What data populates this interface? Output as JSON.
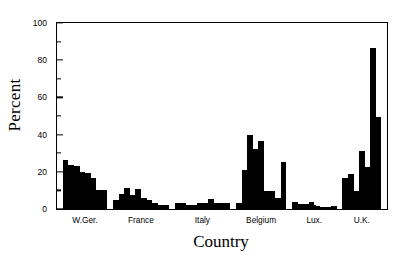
{
  "chart_data": {
    "type": "bar",
    "title": "",
    "xlabel": "Country",
    "ylabel": "Percent",
    "ylim": [
      0,
      100
    ],
    "yticks": [
      0,
      20,
      40,
      60,
      80,
      100
    ],
    "yticklabels": [
      "0",
      "20",
      "40",
      "60",
      "80",
      "100"
    ],
    "yminorticks": [
      10,
      30,
      50,
      70,
      90
    ],
    "grid": false,
    "legend": false,
    "categories": [
      "W.Ger.",
      "France",
      "Italy",
      "Belgium",
      "Lux.",
      "U.K."
    ],
    "groups": [
      {
        "label": "W.Ger.",
        "values": [
          26.5,
          23.5,
          23.0,
          20.0,
          19.5,
          16.5,
          10.0,
          10.0
        ]
      },
      {
        "label": "France",
        "values": [
          5.0,
          8.0,
          11.5,
          7.5,
          10.5,
          6.0,
          5.0,
          3.5,
          2.0,
          2.0
        ]
      },
      {
        "label": "Italy",
        "values": [
          3.5,
          3.5,
          2.0,
          2.0,
          3.0,
          3.5,
          5.5,
          3.0,
          3.0,
          3.5
        ]
      },
      {
        "label": "Belgium",
        "values": [
          3.5,
          21.0,
          40.0,
          32.0,
          36.5,
          9.5,
          9.5,
          6.0,
          25.5
        ]
      },
      {
        "label": "Lux.",
        "values": [
          4.0,
          2.5,
          2.5,
          4.0,
          1.5,
          1.0,
          1.0,
          1.5
        ]
      },
      {
        "label": "U.K.",
        "values": [
          16.5,
          19.0,
          9.5,
          31.0,
          22.5,
          86.5,
          49.5
        ]
      }
    ],
    "max_value": 86.5,
    "max_value_group": "U.K.",
    "bar_color": "#000000",
    "background_color": "#ffffff"
  }
}
